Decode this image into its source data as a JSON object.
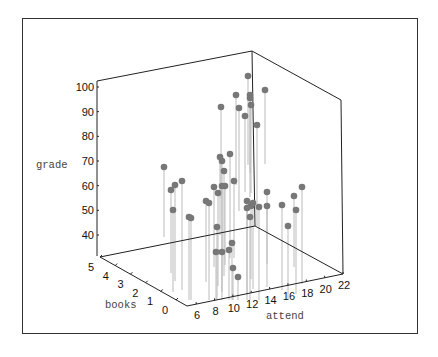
{
  "chart_data": {
    "type": "scatter",
    "subtype": "3d-scatter-with-stems",
    "title": "",
    "xlabel": "attend",
    "ylabel": "books",
    "zlabel": "grade",
    "x_ticks": [
      "6",
      "8",
      "10",
      "12",
      "14",
      "16",
      "18",
      "20",
      "22"
    ],
    "y_ticks": [
      "0",
      "1",
      "2",
      "3",
      "4",
      "5"
    ],
    "z_ticks": [
      "40",
      "50",
      "60",
      "70",
      "80",
      "90",
      "100"
    ],
    "xlim": [
      5,
      22
    ],
    "ylim": [
      0,
      5
    ],
    "zlim": [
      33,
      100
    ],
    "grid": false,
    "legend": null,
    "marker_color": "#777777",
    "stem_color": "#bbbbbb",
    "points_screen": [
      [
        164,
        167
      ],
      [
        171,
        190
      ],
      [
        175,
        185
      ],
      [
        182,
        181
      ],
      [
        173,
        210
      ],
      [
        189,
        217
      ],
      [
        191,
        218
      ],
      [
        206,
        201
      ],
      [
        217,
        227
      ],
      [
        209,
        203
      ],
      [
        214,
        187
      ],
      [
        218,
        193
      ],
      [
        222,
        186
      ],
      [
        225,
        186
      ],
      [
        222,
        161
      ],
      [
        224,
        171
      ],
      [
        220,
        157
      ],
      [
        221,
        107
      ],
      [
        230,
        154
      ],
      [
        234,
        181
      ],
      [
        236,
        95
      ],
      [
        239,
        108
      ],
      [
        245,
        116
      ],
      [
        248,
        76
      ],
      [
        250,
        95
      ],
      [
        250,
        98
      ],
      [
        251,
        105
      ],
      [
        257,
        125
      ],
      [
        265,
        90
      ],
      [
        247,
        208
      ],
      [
        250,
        217
      ],
      [
        251,
        206
      ],
      [
        253,
        203
      ],
      [
        259,
        207
      ],
      [
        267,
        192
      ],
      [
        282,
        205
      ],
      [
        288,
        226
      ],
      [
        294,
        196
      ],
      [
        296,
        210
      ],
      [
        302,
        187
      ],
      [
        233,
        268
      ],
      [
        216,
        252
      ],
      [
        222,
        252
      ],
      [
        229,
        250
      ],
      [
        232,
        243
      ],
      [
        238,
        277
      ],
      [
        247,
        201
      ],
      [
        267,
        206
      ]
    ]
  },
  "axes": {
    "z_label": "grade",
    "y_label": "books",
    "x_label": "attend"
  }
}
